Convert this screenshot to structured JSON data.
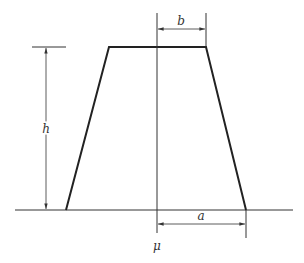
{
  "diagram": {
    "type": "trapezoid-dimension-sketch",
    "labels": {
      "height": "h",
      "top_half_width": "b",
      "bottom_half_width": "a",
      "center": "μ"
    },
    "colors": {
      "line": "#333333",
      "background": "#ffffff"
    }
  }
}
